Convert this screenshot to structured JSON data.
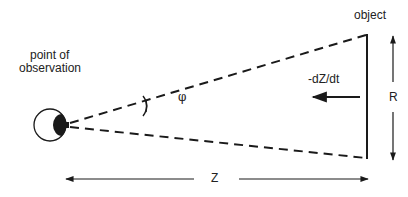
{
  "labels": {
    "observer": [
      "point of",
      "observation"
    ],
    "object": "object",
    "velocity": "-dZ/dt",
    "angle": "φ",
    "size": "R",
    "distance": "Z"
  },
  "colors": {
    "stroke": "#1a1a1a",
    "background": "#ffffff"
  }
}
